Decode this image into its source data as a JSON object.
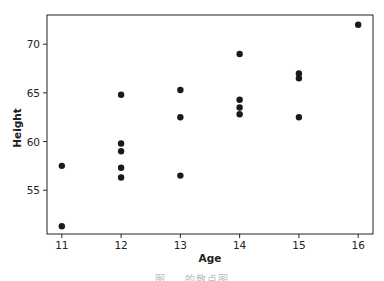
{
  "chart_data": {
    "type": "scatter",
    "title": "",
    "xlabel": "Age",
    "ylabel": "Height",
    "xlim": [
      10.75,
      16.25
    ],
    "ylim": [
      50.5,
      73.0
    ],
    "xticks": [
      11,
      12,
      13,
      14,
      15,
      16
    ],
    "yticks": [
      55,
      60,
      65,
      70
    ],
    "grid": false,
    "legend": null,
    "marker_color": "#1a1a1a",
    "points": [
      {
        "x": 11,
        "y": 57.5
      },
      {
        "x": 11,
        "y": 51.3
      },
      {
        "x": 12,
        "y": 64.8
      },
      {
        "x": 12,
        "y": 59.8
      },
      {
        "x": 12,
        "y": 59.0
      },
      {
        "x": 12,
        "y": 57.3
      },
      {
        "x": 12,
        "y": 56.3
      },
      {
        "x": 13,
        "y": 65.3
      },
      {
        "x": 13,
        "y": 62.5
      },
      {
        "x": 13,
        "y": 56.5
      },
      {
        "x": 14,
        "y": 69.0
      },
      {
        "x": 14,
        "y": 64.3
      },
      {
        "x": 14,
        "y": 63.5
      },
      {
        "x": 14,
        "y": 62.8
      },
      {
        "x": 15,
        "y": 67.0
      },
      {
        "x": 15,
        "y": 66.5
      },
      {
        "x": 15,
        "y": 62.5
      },
      {
        "x": 16,
        "y": 72.0
      }
    ]
  },
  "caption": {
    "text": "图 … 的散点图"
  }
}
